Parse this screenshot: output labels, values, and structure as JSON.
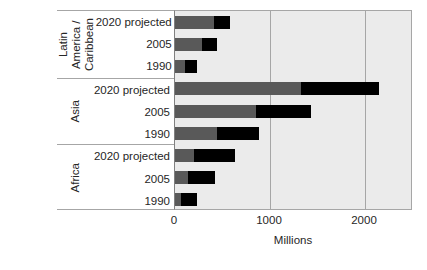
{
  "chart_data": {
    "type": "bar",
    "orientation": "horizontal",
    "stacked": true,
    "title": "",
    "xlabel": "Millions",
    "ylabel": "",
    "xlim": [
      0,
      2200
    ],
    "xticks": [
      0,
      1000,
      2000
    ],
    "xticklabels": [
      "0",
      "1000",
      "2000"
    ],
    "grid": true,
    "legend": {
      "position": "inside-top-right",
      "entries": [
        {
          "name": "Slum population",
          "color": "#000000"
        }
      ]
    },
    "series": [
      {
        "name": "Non-slum population",
        "color": "#595959"
      },
      {
        "name": "Slum population",
        "color": "#000000"
      }
    ],
    "groups": [
      {
        "name": "Latin America / Caribbean",
        "name_display": "Latin\nAmerica /\nCaribbean",
        "rows": [
          {
            "label": "2020 projected",
            "non_slum": 410,
            "slum": 170,
            "total": 580
          },
          {
            "label": "2005",
            "non_slum": 285,
            "slum": 155,
            "total": 440
          },
          {
            "label": "1990",
            "non_slum": 110,
            "slum": 120,
            "total": 230
          }
        ]
      },
      {
        "name": "Asia",
        "name_display": "Asia",
        "rows": [
          {
            "label": "2020 projected",
            "non_slum": 1330,
            "slum": 820,
            "total": 2150
          },
          {
            "label": "2005",
            "non_slum": 855,
            "slum": 575,
            "total": 1430
          },
          {
            "label": "1990",
            "non_slum": 440,
            "slum": 445,
            "total": 885
          }
        ]
      },
      {
        "name": "Africa",
        "name_display": "Africa",
        "rows": [
          {
            "label": "2020 projected",
            "non_slum": 200,
            "slum": 432,
            "total": 632
          },
          {
            "label": "2005",
            "non_slum": 137,
            "slum": 283,
            "total": 420
          },
          {
            "label": "1990",
            "non_slum": 63,
            "slum": 167,
            "total": 230
          }
        ]
      }
    ]
  },
  "axis": {
    "tick_0": "0",
    "tick_1000": "1000",
    "tick_2000": "2000",
    "title": "Millions"
  },
  "legend": {
    "slum_label": "Slum population"
  },
  "groups": {
    "lac": {
      "name": "Latin\nAmerica /\nCaribbean",
      "row0": "2020 projected",
      "row1": "2005",
      "row2": "1990"
    },
    "asia": {
      "name": "Asia",
      "row0": "2020 projected",
      "row1": "2005",
      "row2": "1990"
    },
    "africa": {
      "name": "Africa",
      "row0": "2020 projected",
      "row1": "2005",
      "row2": "1990"
    }
  },
  "colors": {
    "plot_background": "#ebebeb",
    "gridline": "#a6a6a6",
    "non_slum_bar": "#595959",
    "slum_bar": "#000000",
    "text": "#262626"
  }
}
